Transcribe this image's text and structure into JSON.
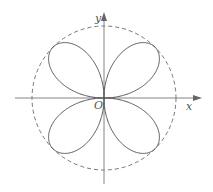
{
  "figure": {
    "curve": "r = a·sin 2θ (four petals)",
    "petal_count": 4,
    "labels": {
      "x_axis": "x",
      "y_axis": "y",
      "origin": "O"
    },
    "colors": {
      "curve": "#555555",
      "circle": "#666666",
      "axes": "#777777",
      "background": "#ffffff"
    },
    "geometry": {
      "origin_px": [
        104,
        98
      ],
      "circle_radius_px": 72
    }
  }
}
